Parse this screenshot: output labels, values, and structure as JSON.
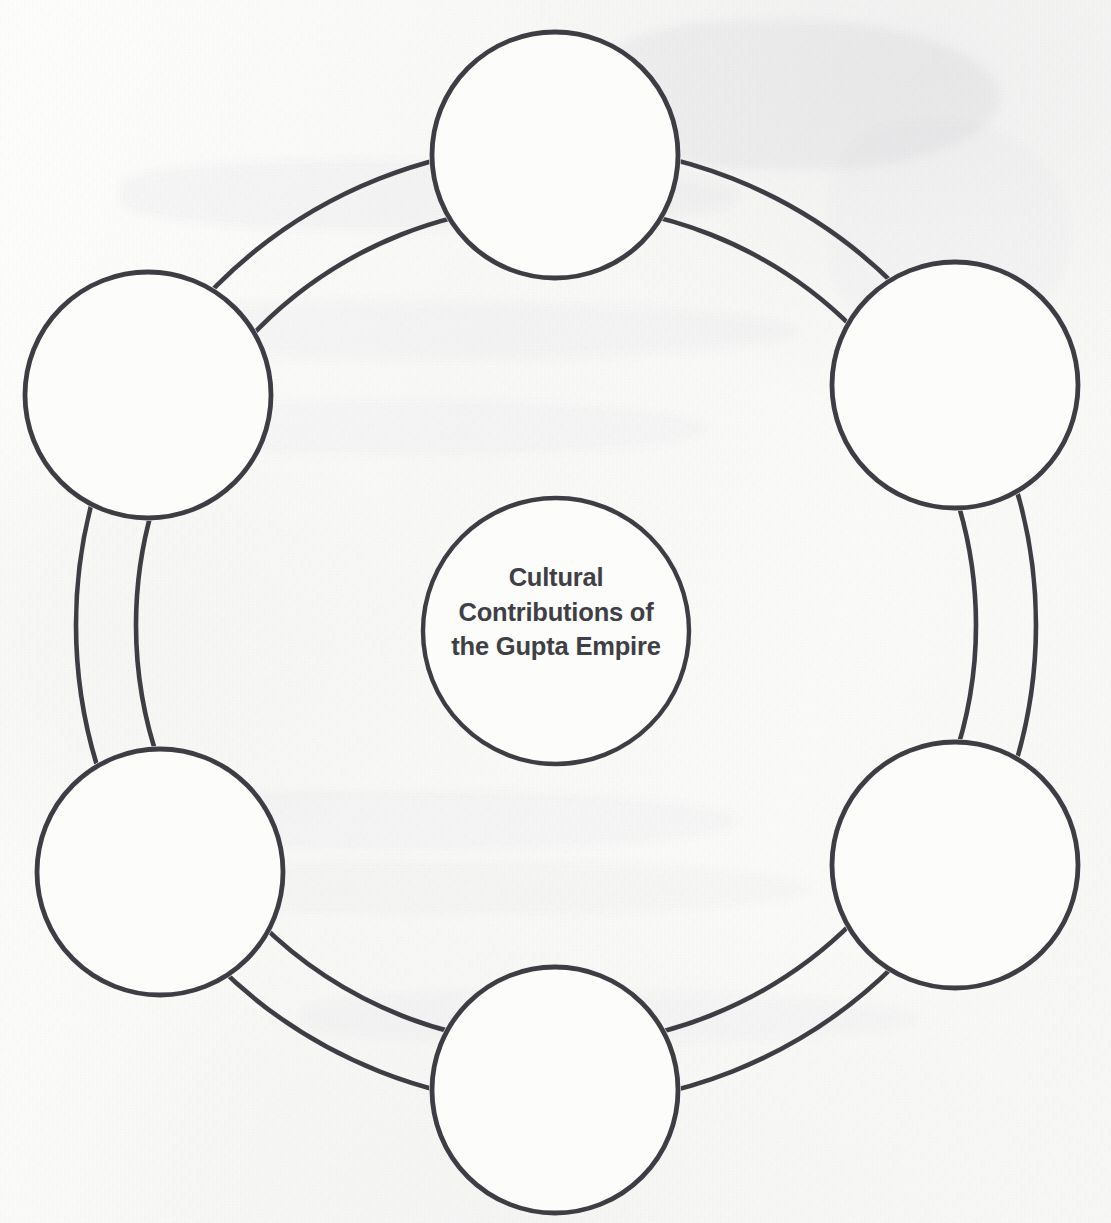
{
  "document": {
    "type": "worksheet-graphic-organizer",
    "medium": "scanned-paper",
    "background_color": "#fbfbfa",
    "stroke_color": "#3d3d44",
    "text_color": "#3f4045"
  },
  "center": {
    "name": "center-node",
    "title_lines": [
      "Cultural",
      "Contributions of",
      "the Gupta Empire"
    ],
    "title_full": "Cultural Contributions of the Gupta Empire",
    "cx": 556,
    "cy": 631,
    "r": 133
  },
  "ring": {
    "inner_radius": 420,
    "outer_radius": 480,
    "cx": 556,
    "cy": 625
  },
  "nodes": [
    {
      "id": "node-top",
      "label": "",
      "angle_deg": -90,
      "cx": 555,
      "cy": 155,
      "r": 123
    },
    {
      "id": "node-upper-right",
      "label": "",
      "angle_deg": -30,
      "cx": 955,
      "cy": 385,
      "r": 123
    },
    {
      "id": "node-lower-right",
      "label": "",
      "angle_deg": 30,
      "cx": 955,
      "cy": 865,
      "r": 123
    },
    {
      "id": "node-bottom",
      "label": "",
      "angle_deg": 90,
      "cx": 555,
      "cy": 1090,
      "r": 123
    },
    {
      "id": "node-lower-left",
      "label": "",
      "angle_deg": 150,
      "cx": 160,
      "cy": 872,
      "r": 123
    },
    {
      "id": "node-upper-left",
      "label": "",
      "angle_deg": -150,
      "cx": 148,
      "cy": 395,
      "r": 123
    }
  ]
}
